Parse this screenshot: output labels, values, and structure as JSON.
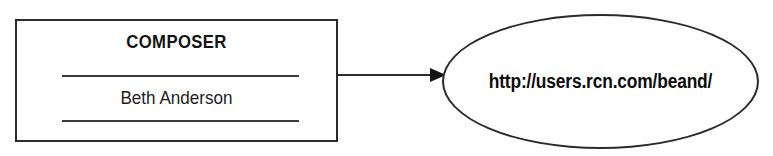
{
  "diagram": {
    "type": "uml-class-to-node",
    "background_color": "#ffffff",
    "stroke_color": "#2b2b2b",
    "class_box": {
      "name": "COMPOSER",
      "attribute": "Beth Anderson",
      "compartment_count": 3
    },
    "connector": {
      "kind": "arrow",
      "direction": "left-to-right",
      "label": ""
    },
    "ellipse_node": {
      "label": "http://users.rcn.com/beand/"
    }
  }
}
